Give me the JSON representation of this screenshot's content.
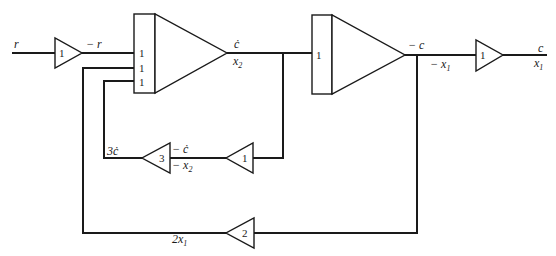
{
  "diagram": {
    "type": "analog-computer block diagram",
    "blocks": {
      "input_inverter": {
        "kind": "inverter",
        "gain": "1"
      },
      "integrator_1": {
        "kind": "summing-integrator",
        "input_gains": [
          "1",
          "1",
          "1"
        ]
      },
      "integrator_2": {
        "kind": "integrator",
        "input_gains": [
          "1"
        ]
      },
      "output_inverter": {
        "kind": "inverter",
        "gain": "1"
      },
      "rate_inverter": {
        "kind": "inverter",
        "gain": "1"
      },
      "rate_gain": {
        "kind": "amplifier",
        "gain": "3"
      },
      "position_gain": {
        "kind": "amplifier",
        "gain": "2"
      }
    },
    "labels": {
      "input": "r",
      "neg_input": "− r",
      "cdot": "ċ",
      "x2": "x",
      "x2_sub": "2",
      "neg_c": "− c",
      "neg_x1": "− x",
      "neg_x1_sub": "1",
      "out_c": "c",
      "out_x1": "x",
      "out_x1_sub": "1",
      "three_cdot": "3ċ",
      "neg_cdot": "− ċ",
      "neg_x2": "− x",
      "neg_x2_sub": "2",
      "two_x1": "2x",
      "two_x1_sub": "1"
    }
  }
}
